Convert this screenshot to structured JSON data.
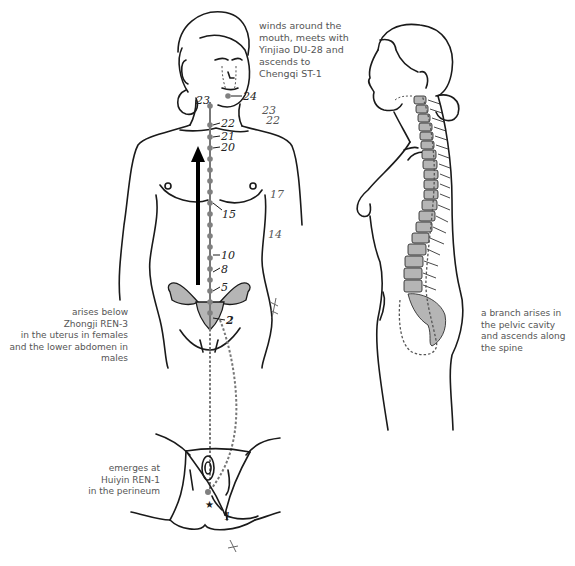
{
  "captions": {
    "mouth": {
      "lines": [
        "winds around the",
        "mouth, meets with",
        "Yinjiao DU-28 and",
        "ascends to",
        "Chengqi ST-1"
      ]
    },
    "origin": {
      "lines": [
        "arises below",
        "Zhongji REN-3",
        "in the uterus in females",
        "and the lower abdomen in",
        "males"
      ]
    },
    "perineum": {
      "lines": [
        "emerges at",
        "Huiyin REN-1",
        "in the perineum"
      ]
    },
    "branch": {
      "lines": [
        "a branch arises in",
        "the pelvic cavity",
        "and ascends along",
        "the spine"
      ]
    }
  },
  "point_labels": {
    "p24": "24",
    "p23": "23",
    "p22": "22",
    "p21": "21",
    "p20": "20",
    "p15": "15",
    "p10": "10",
    "p8": "8",
    "p5": "5",
    "p2": "2",
    "p1": "1"
  },
  "annotations": {
    "a23": "23",
    "a22": "22",
    "a17": "17",
    "a14": "14"
  },
  "colors": {
    "line": "#1a1a1a",
    "channel_dot": "#808080",
    "organ_fill": "#b5b5b5",
    "caption_text": "#555555"
  }
}
